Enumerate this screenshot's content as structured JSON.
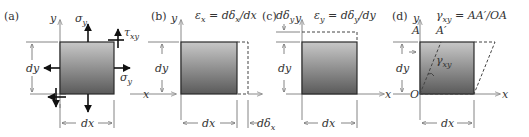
{
  "figure": {
    "colors": {
      "element_top": "#c8c8c8",
      "element_bottom": "#5a5a5a",
      "axes": "#888888",
      "outline": "#2a2a2a"
    },
    "panels": [
      {
        "id": "a",
        "label": "(a)",
        "axis_x": "x",
        "axis_y": "y",
        "stress_labels": {
          "normal_y": "σ",
          "normal_y_sub": "y",
          "shear": "τ",
          "shear_sub": "xy",
          "normal_x": "σ",
          "normal_x_sub": "y"
        },
        "dim_h": "dx",
        "dim_v": "dy"
      },
      {
        "id": "b",
        "label": "(b)",
        "axis_x": "x",
        "axis_y": "y",
        "equation": "ε",
        "equation_sub": "x",
        "equation_rhs": " = dδ",
        "equation_rhs_sub": "x",
        "equation_tail": "/dx",
        "dim_h": "dx",
        "dim_v": "dy",
        "dim_extra": "dδ",
        "dim_extra_sub": "x"
      },
      {
        "id": "c",
        "label": "(c)",
        "axis_x": "x",
        "axis_y": "y",
        "equation": "ε",
        "equation_sub": "y",
        "equation_rhs": " = dδ",
        "equation_rhs_sub": "y",
        "equation_tail": "/dy",
        "dim_h": "dx",
        "dim_v": "dy",
        "dim_extra": "dδ",
        "dim_extra_sub": "y"
      },
      {
        "id": "d",
        "label": "(d)",
        "axis_x": "x",
        "axis_y": "y",
        "equation": "γ",
        "equation_sub": "xy",
        "equation_tail": " = AA′/OA",
        "point_a": "A",
        "point_a_prime": "A′",
        "origin": "O",
        "angle": "γ",
        "angle_sub": "xy",
        "dim_h": "dx",
        "dim_v": "dy"
      }
    ]
  }
}
